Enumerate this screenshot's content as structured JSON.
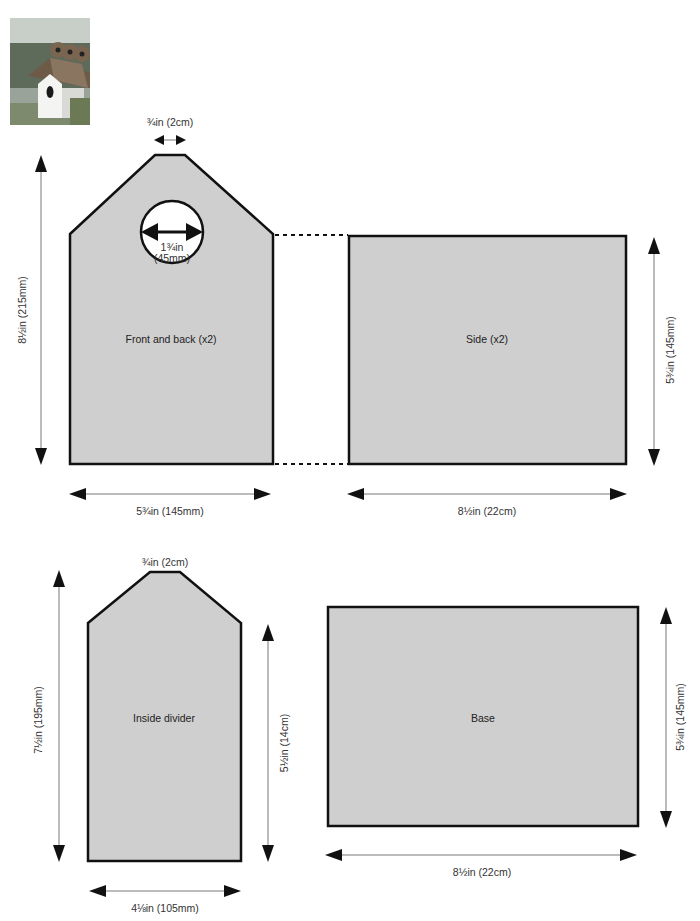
{
  "photo": {
    "alt": "Birdhouse with thatched roof photo"
  },
  "pieces": {
    "front_back": {
      "label": "Front and back (x2)",
      "top_width": "¾in (2cm)",
      "hole_diameter_line1": "1¾in",
      "hole_diameter_line2": "(45mm)",
      "height": "8½in (215mm)",
      "width": "5¾in (145mm)"
    },
    "side": {
      "label": "Side (x2)",
      "height": "5¾in (145mm)",
      "width": "8½in (22cm)"
    },
    "inside_divider": {
      "label": "Inside divider",
      "top_width": "¾in (2cm)",
      "total_height": "7½in (195mm)",
      "side_height": "5½in (14cm)",
      "width": "4⅛in (105mm)"
    },
    "base": {
      "label": "Base",
      "height": "5¾in (145mm)",
      "width": "8½in (22cm)"
    }
  },
  "colors": {
    "piece_fill": "#cfcfcf",
    "outline": "#111111",
    "dimension_line": "#555555"
  }
}
